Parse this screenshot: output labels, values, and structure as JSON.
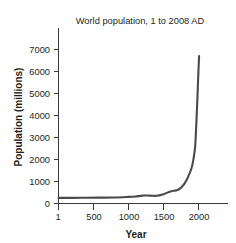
{
  "figure": {
    "background_color": "#ffffff",
    "ink_color": "#231f20",
    "curve_color": "#4a4a4a",
    "axis_color": "#3a3a3a"
  },
  "chart_data": {
    "type": "line",
    "title": "World population, 1 to 2008 AD",
    "xlabel": "Year",
    "ylabel": "Population (millions)",
    "xlim": [
      1,
      2400
    ],
    "ylim": [
      0,
      7400
    ],
    "grid": false,
    "legend": null,
    "x_ticks": [
      1,
      500,
      1000,
      1500,
      2000
    ],
    "x_tick_labels": [
      "1",
      "500",
      "1000",
      "1500",
      "2000"
    ],
    "y_ticks": [
      0,
      1000,
      2000,
      3000,
      4000,
      5000,
      6000,
      7000
    ],
    "y_tick_labels": [
      "0",
      "1000",
      "2000",
      "3000",
      "4000",
      "5000",
      "6000",
      "7000"
    ],
    "series": [
      {
        "name": "World population",
        "x": [
          1,
          200,
          400,
          600,
          800,
          1000,
          1100,
          1200,
          1300,
          1400,
          1500,
          1600,
          1700,
          1750,
          1800,
          1850,
          1900,
          1927,
          1950,
          1960,
          1970,
          1980,
          1990,
          2000,
          2008
        ],
        "values": [
          255,
          257,
          260,
          265,
          275,
          300,
          315,
          360,
          360,
          350,
          425,
          545,
          610,
          720,
          900,
          1200,
          1600,
          2000,
          2520,
          3020,
          3700,
          4440,
          5270,
          6080,
          6700
        ]
      }
    ]
  }
}
